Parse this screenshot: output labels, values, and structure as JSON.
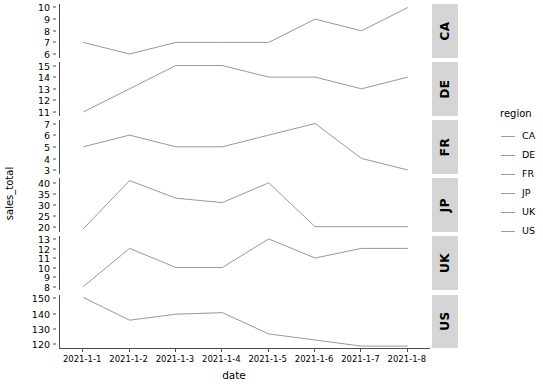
{
  "chart_data": {
    "type": "line",
    "title": "",
    "xlabel": "date",
    "ylabel": "sales_total",
    "grid": false,
    "legend": {
      "title": "region",
      "position": "right",
      "entries": [
        "CA",
        "DE",
        "FR",
        "JP",
        "UK",
        "US"
      ]
    },
    "facet": {
      "by": "region",
      "position": "right",
      "labels": [
        "CA",
        "DE",
        "FR",
        "JP",
        "UK",
        "US"
      ]
    },
    "x": [
      "2021-1-1",
      "2021-1-2",
      "2021-1-3",
      "2021-1-4",
      "2021-1-5",
      "2021-1-6",
      "2021-1-7",
      "2021-1-8"
    ],
    "line_color": "#999999",
    "panels": [
      {
        "label": "CA",
        "values": [
          7,
          6,
          7,
          7,
          7,
          9,
          8,
          10
        ],
        "ylim": [
          5.7,
          10.3
        ],
        "yticks": [
          6,
          7,
          8,
          9,
          10
        ]
      },
      {
        "label": "DE",
        "values": [
          11,
          13,
          15,
          15,
          14,
          14,
          13,
          14
        ],
        "ylim": [
          10.7,
          15.3
        ],
        "yticks": [
          11,
          12,
          13,
          14,
          15
        ]
      },
      {
        "label": "FR",
        "values": [
          5,
          6,
          5,
          5,
          6,
          7,
          4,
          3
        ],
        "ylim": [
          2.7,
          7.3
        ],
        "yticks": [
          3,
          4,
          5,
          6,
          7
        ]
      },
      {
        "label": "JP",
        "values": [
          19,
          41,
          33,
          31,
          40,
          20,
          20,
          20
        ],
        "ylim": [
          17.8,
          42.2
        ],
        "yticks": [
          20,
          25,
          30,
          35,
          40
        ]
      },
      {
        "label": "UK",
        "values": [
          8,
          12,
          10,
          10,
          13,
          11,
          12,
          12
        ],
        "ylim": [
          7.7,
          13.3
        ],
        "yticks": [
          8,
          9,
          10,
          11,
          12,
          13
        ]
      },
      {
        "label": "US",
        "values": [
          151,
          136,
          140,
          141,
          127,
          123,
          119,
          119
        ],
        "ylim": [
          117.4,
          152.6
        ],
        "yticks": [
          120,
          130,
          140,
          150
        ]
      }
    ]
  }
}
